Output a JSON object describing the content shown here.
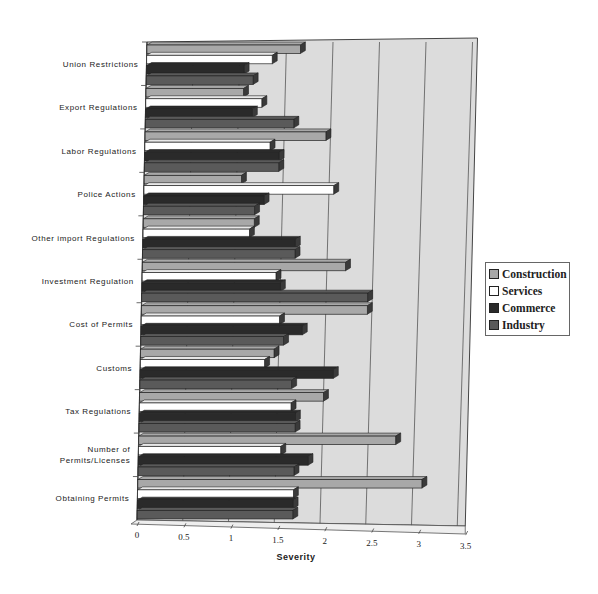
{
  "chart_data": {
    "type": "bar",
    "orientation": "horizontal",
    "style": "3d-clustered",
    "title": "",
    "xlabel": "Severity",
    "ylabel": "",
    "xlim": [
      0,
      3.5
    ],
    "x_ticks": [
      "0",
      "0.5",
      "1",
      "1.5",
      "2",
      "2.5",
      "3",
      "3.5"
    ],
    "grid": true,
    "legend_position": "right",
    "categories": [
      "Union Restrictions",
      "Export Regulations",
      "Labor Regulations",
      "Police Actions",
      "Other import Regulations",
      "Investment Regulation",
      "Cost of Permits",
      "Customs",
      "Tax Regulations",
      "Number of Permits/Licenses",
      "Obtaining Permits"
    ],
    "series": [
      {
        "name": "Construction",
        "color": "#a8a8a8",
        "values": [
          1.65,
          1.05,
          1.95,
          1.05,
          1.2,
          2.2,
          2.45,
          1.45,
          2.0,
          2.8,
          3.1
        ]
      },
      {
        "name": "Services",
        "color": "#ffffff",
        "values": [
          1.35,
          1.25,
          1.35,
          2.05,
          1.15,
          1.45,
          1.5,
          1.35,
          1.65,
          1.55,
          1.7
        ]
      },
      {
        "name": "Commerce",
        "color": "#2a2a2a",
        "values": [
          1.05,
          1.15,
          1.45,
          1.3,
          1.65,
          1.5,
          1.75,
          2.1,
          1.7,
          1.85,
          1.7
        ]
      },
      {
        "name": "Industry",
        "color": "#5a5a5a",
        "values": [
          1.15,
          1.6,
          1.45,
          1.2,
          1.65,
          2.45,
          1.55,
          1.65,
          1.7,
          1.7,
          1.7
        ]
      }
    ]
  },
  "legend": {
    "items": [
      {
        "label": "Construction",
        "color": "#a8a8a8"
      },
      {
        "label": "Services",
        "color": "#ffffff"
      },
      {
        "label": "Commerce",
        "color": "#2a2a2a"
      },
      {
        "label": "Industry",
        "color": "#5a5a5a"
      }
    ]
  }
}
